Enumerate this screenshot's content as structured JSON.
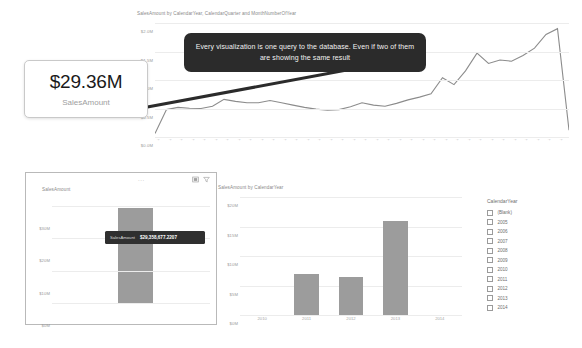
{
  "kpi_card": {
    "value": "$29.36M",
    "label": "SalesAmount"
  },
  "callout": {
    "text": "Every visualization is one query to the database. Even if two of them are showing the same result"
  },
  "top_chart": {
    "title": "SalesAmount by CalendarYear, CalendarQuarter and MonthNumberOfYear"
  },
  "left_panel": {
    "title": "SalesAmount",
    "ellipsis": "...",
    "focus_icon": "focus-mode-icon",
    "filter_icon": "filter-icon",
    "tooltip": {
      "label": "SalesAmount",
      "value": "$29,358,677.2207"
    }
  },
  "right_chart": {
    "title": "SalesAmount by CalendarYear"
  },
  "slicer": {
    "title": "CalendarYear",
    "items": [
      {
        "label": "(Blank)",
        "checked": false
      },
      {
        "label": "2005",
        "checked": false
      },
      {
        "label": "2006",
        "checked": false
      },
      {
        "label": "2007",
        "checked": false
      },
      {
        "label": "2008",
        "checked": false
      },
      {
        "label": "2009",
        "checked": false
      },
      {
        "label": "2010",
        "checked": false
      },
      {
        "label": "2011",
        "checked": false
      },
      {
        "label": "2012",
        "checked": false
      },
      {
        "label": "2013",
        "checked": false
      },
      {
        "label": "2014",
        "checked": false
      }
    ]
  },
  "colors": {
    "bar": "#9c9c9c",
    "line": "#8c8c8c",
    "tooltip_bg": "#2b2b2b",
    "grid": "#ececec",
    "axis_text": "#a8a8a8"
  },
  "chart_data": [
    {
      "id": "top_line",
      "type": "line",
      "title": "SalesAmount by CalendarYear, CalendarQuarter and MonthNumberOfYear",
      "xlabel": "",
      "ylabel": "",
      "ylim": [
        0,
        2000000
      ],
      "yticks": [
        "$0.0M",
        "$0.5M",
        "$1.0M",
        "$1.5M",
        "$2.0M"
      ],
      "ytick_values": [
        0,
        500000,
        1000000,
        1500000,
        2000000
      ],
      "grid": true,
      "legend": "none",
      "x": [
        "2011 1 1",
        "2011 1 2",
        "2011 1 3",
        "2011 2 4",
        "2011 2 5",
        "2011 2 6",
        "2011 3 7",
        "2011 3 8",
        "2011 3 9",
        "2011 4 10",
        "2011 4 11",
        "2011 4 12",
        "2012 1 1",
        "2012 1 2",
        "2012 1 3",
        "2012 2 4",
        "2012 2 5",
        "2012 2 6",
        "2012 3 7",
        "2012 3 8",
        "2012 3 9",
        "2012 4 10",
        "2012 4 11",
        "2012 4 12",
        "2013 1 1",
        "2013 1 2",
        "2013 1 3",
        "2013 2 4",
        "2013 2 5",
        "2013 2 6",
        "2013 3 7",
        "2013 3 8",
        "2013 3 9",
        "2013 4 10",
        "2013 4 11",
        "2013 4 12",
        "2014 1 1"
      ],
      "values": [
        60000,
        480000,
        520000,
        505000,
        500000,
        540000,
        660000,
        625000,
        600000,
        600000,
        640000,
        600000,
        560000,
        520000,
        490000,
        470000,
        480000,
        530000,
        600000,
        560000,
        540000,
        590000,
        650000,
        700000,
        760000,
        1040000,
        920000,
        1160000,
        1470000,
        1290000,
        1350000,
        1330000,
        1430000,
        1560000,
        1800000,
        1900000,
        120000
      ]
    },
    {
      "id": "left_panel_bar",
      "type": "bar",
      "title": "SalesAmount",
      "xlabel": "",
      "ylabel": "",
      "ylim": [
        0,
        32000000
      ],
      "yticks": [
        "$0M",
        "$10M",
        "$20M",
        "$30M"
      ],
      "ytick_values": [
        0,
        10000000,
        20000000,
        30000000
      ],
      "grid": true,
      "categories": [
        "Total"
      ],
      "values": [
        29358677.2207
      ],
      "data_label": "$29,358,677.2207"
    },
    {
      "id": "right_bar",
      "type": "bar",
      "title": "SalesAmount by CalendarYear",
      "xlabel": "",
      "ylabel": "",
      "ylim": [
        0,
        20000000
      ],
      "yticks": [
        "$0M",
        "$5M",
        "$10M",
        "$15M",
        "$20M"
      ],
      "ytick_values": [
        0,
        5000000,
        10000000,
        15000000,
        20000000
      ],
      "grid": true,
      "categories": [
        "2010",
        "2011",
        "2012",
        "2013",
        "2014"
      ],
      "values": [
        0,
        7000000,
        6400000,
        16000000,
        0
      ]
    }
  ]
}
